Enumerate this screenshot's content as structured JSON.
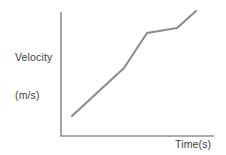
{
  "figure": {
    "background_color": "#ffffff",
    "axis_color": "#8f8f8f",
    "line_color": "#8c8c8c",
    "text_color": "#3d3d3d"
  },
  "labels": {
    "y_axis_line1": "Velocity",
    "y_axis_line2": "(m/s)",
    "x_axis": "Time(s)"
  },
  "chart_data": {
    "type": "line",
    "title": "",
    "xlabel": "Time(s)",
    "ylabel": "Velocity (m/s)",
    "grid": false,
    "legend": false,
    "axis_arrows": false,
    "tick_labels_x": [],
    "tick_labels_y": [],
    "xlim": [
      0,
      10
    ],
    "ylim": [
      0,
      10
    ],
    "series": [
      {
        "name": "velocity",
        "comment": "Piecewise linear: gentle rise, steeper rise, plateau, final rise",
        "x": [
          0.72,
          4.12,
          5.62,
          7.56,
          8.76
        ],
        "y": [
          1.68,
          5.48,
          8.32,
          8.72,
          10.0
        ]
      }
    ],
    "pixel_path": {
      "comment": "Polyline vertices in screenshot pixel coordinates",
      "points": [
        [
          72,
          116
        ],
        [
          124,
          68
        ],
        [
          147,
          33
        ],
        [
          177,
          28
        ],
        [
          196,
          11
        ]
      ]
    },
    "axes_pixels": {
      "y_axis": [
        [
          61,
          12
        ],
        [
          61,
          136
        ]
      ],
      "x_axis": [
        [
          61,
          136
        ],
        [
          214,
          136
        ]
      ]
    }
  }
}
